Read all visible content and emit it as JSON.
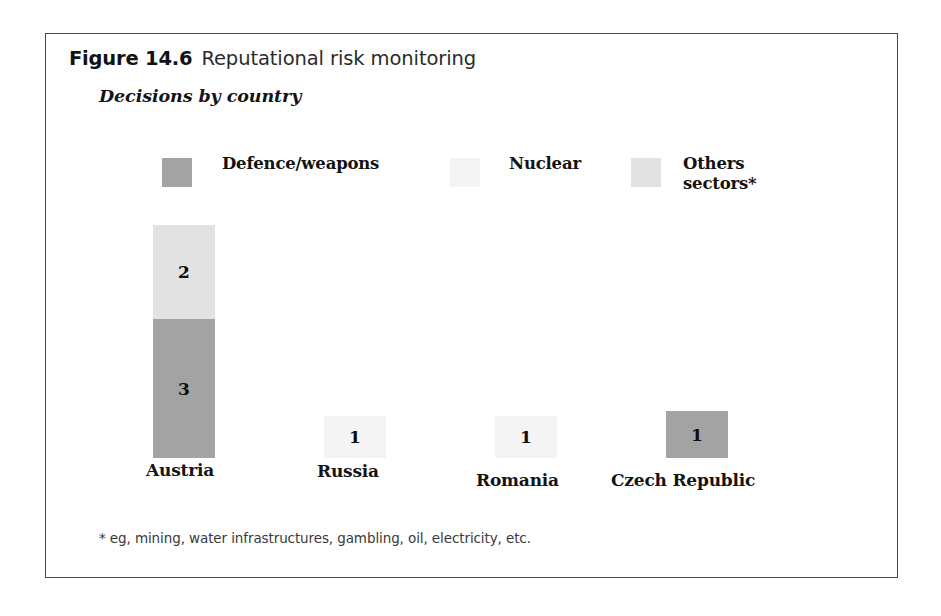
{
  "figure": {
    "number_label": "Figure 14.6",
    "title": "Reputational risk monitoring",
    "subtitle": "Decisions by country",
    "footnote": "* eg, mining, water infrastructures, gambling, oil, electricity, etc."
  },
  "colors": {
    "defence_weapons": "#a3a3a3",
    "nuclear": "#f4f4f4",
    "others_sectors": "#e2e2e2",
    "frame_border": "#4a4a4a",
    "text": "#131313",
    "background": "#ffffff"
  },
  "legend": {
    "items": [
      {
        "label": "Defence/weapons",
        "color_key": "defence_weapons",
        "swatch_x": 116,
        "label_x": 176
      },
      {
        "label": "Nuclear",
        "color_key": "nuclear",
        "swatch_x": 404,
        "label_x": 463
      },
      {
        "label": "Others\nsectors*",
        "color_key": "others_sectors",
        "swatch_x": 585,
        "label_x": 637
      }
    ]
  },
  "chart_data": {
    "type": "bar",
    "subtype": "stacked-bar",
    "title": "Reputational risk monitoring",
    "subtitle": "Decisions by country",
    "xlabel": "",
    "ylabel": "",
    "grid": false,
    "legend_position": "top",
    "ylim": [
      0,
      5
    ],
    "categories": [
      "Austria",
      "Russia",
      "Romania",
      "Czech Republic"
    ],
    "series": [
      {
        "name": "Defence/weapons",
        "color_key": "defence_weapons",
        "values": [
          3,
          0,
          0,
          1
        ]
      },
      {
        "name": "Nuclear",
        "color_key": "nuclear",
        "values": [
          0,
          1,
          1,
          0
        ]
      },
      {
        "name": "Others sectors*",
        "color_key": "others_sectors",
        "values": [
          2,
          0,
          0,
          0
        ]
      }
    ],
    "totals": [
      5,
      1,
      1,
      1
    ],
    "value_labels": [
      "2",
      "3",
      "1",
      "1",
      "1"
    ],
    "footnote": "* eg, mining, water infrastructures, gambling, oil, electricity, etc."
  },
  "bars": [
    {
      "category": "Austria",
      "bar_x": 107,
      "bar_width": 62,
      "label_x": 100,
      "label_y": 426,
      "segments": [
        {
          "series": "Others sectors*",
          "value": "2",
          "color_key": "others_sectors",
          "top": 191,
          "height": 94
        },
        {
          "series": "Defence/weapons",
          "value": "3",
          "color_key": "defence_weapons",
          "top": 285,
          "height": 139
        }
      ]
    },
    {
      "category": "Russia",
      "bar_x": 278,
      "bar_width": 62,
      "label_x": 271,
      "label_y": 427,
      "segments": [
        {
          "series": "Nuclear",
          "value": "1",
          "color_key": "nuclear",
          "top": 382,
          "height": 42
        }
      ]
    },
    {
      "category": "Romania",
      "bar_x": 449,
      "bar_width": 62,
      "label_x": 430,
      "label_y": 436,
      "segments": [
        {
          "series": "Nuclear",
          "value": "1",
          "color_key": "nuclear",
          "top": 382,
          "height": 42
        }
      ]
    },
    {
      "category": "Czech Republic",
      "bar_x": 620,
      "bar_width": 62,
      "label_x": 565,
      "label_y": 436,
      "segments": [
        {
          "series": "Defence/weapons",
          "value": "1",
          "color_key": "defence_weapons",
          "top": 377,
          "height": 47
        }
      ]
    }
  ]
}
